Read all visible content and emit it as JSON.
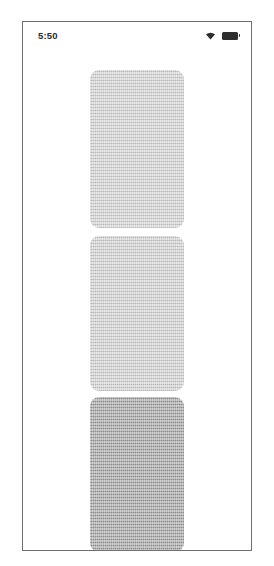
{
  "device": {
    "frame_label": "phone-screen-mockup",
    "background_color": "#ffffff",
    "border_color": "#6e6e6e"
  },
  "status_bar": {
    "time": "5:50",
    "wifi_icon": "wifi-icon",
    "battery_icon": "battery-icon",
    "battery_state": "full"
  },
  "card_list": {
    "name": "placeholder-card-list",
    "cards": [
      {
        "id": "card-1",
        "label": "",
        "color": "#cfcfcf",
        "top": 21,
        "height": 158,
        "partial": false,
        "has_dark_bar": false
      },
      {
        "id": "card-2",
        "label": "",
        "color": "#cdcdcd",
        "top": 187,
        "height": 155,
        "partial": false,
        "has_dark_bar": false
      },
      {
        "id": "card-3",
        "label": "",
        "color": "#9b9b9b",
        "top": 348,
        "height": 155,
        "partial": false,
        "has_dark_bar": false
      },
      {
        "id": "card-4",
        "label": "",
        "color": "#8f8f8f",
        "top": 511,
        "height": 22,
        "partial": true,
        "has_dark_bar": true
      }
    ]
  }
}
